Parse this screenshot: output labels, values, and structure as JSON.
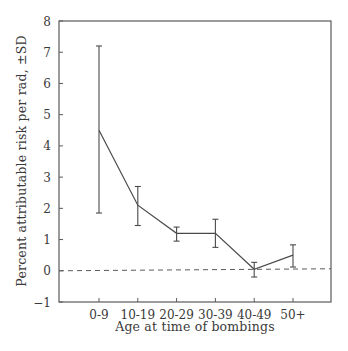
{
  "chart_data": {
    "type": "line",
    "title": "",
    "xlabel": "Age at time of bombings",
    "ylabel": "Percent attributable risk per rad, ±SD",
    "categories": [
      "0-9",
      "10-19",
      "20-29",
      "30-39",
      "40-49",
      "50+"
    ],
    "series": [
      {
        "name": "Percent attributable risk per rad",
        "values": [
          4.5,
          2.1,
          1.2,
          1.2,
          0.05,
          0.5
        ],
        "error_lower": [
          1.85,
          1.45,
          0.95,
          0.75,
          -0.2,
          0.12
        ],
        "error_upper": [
          7.2,
          2.7,
          1.4,
          1.65,
          0.27,
          0.83
        ]
      }
    ],
    "reference_line": {
      "y": 0,
      "style": "dashed"
    },
    "ylim": [
      -1,
      8
    ],
    "yticks": [
      -1,
      0,
      1,
      2,
      3,
      4,
      5,
      6,
      7,
      8
    ],
    "grid": false,
    "legend": null,
    "colors": {
      "line": "#4a4a4a",
      "axis": "#5a5a5a",
      "text": "#3a3a3a"
    }
  }
}
